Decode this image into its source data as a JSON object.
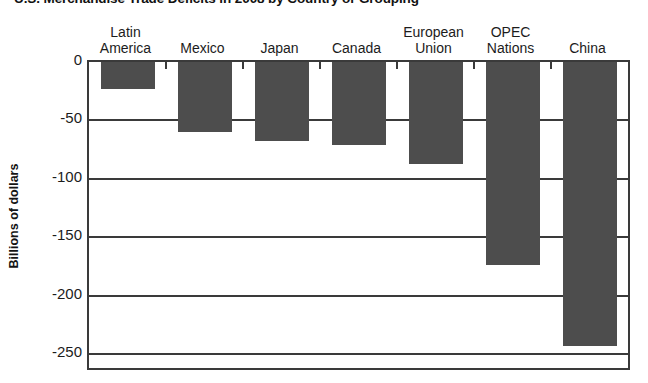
{
  "chart_data": {
    "type": "bar",
    "title": "U.S. Merchandise Trade Deficits in 2008 by Country or Grouping",
    "xlabel": "",
    "ylabel": "Billions of dollars",
    "categories": [
      "Latin\nAmerica",
      "Mexico",
      "Japan",
      "Canada",
      "European\nUnion",
      "OPEC\nNations",
      "China"
    ],
    "values": [
      -23,
      -60,
      -68,
      -71,
      -87,
      -174,
      -243
    ],
    "ylim": [
      -250,
      0
    ],
    "yticks": [
      0,
      -50,
      -100,
      -150,
      -200,
      -250
    ],
    "ytick_labels": [
      "0",
      "-50",
      "-100",
      "-150",
      "-200",
      "-250"
    ],
    "grid": true,
    "legend": "none",
    "bar_color": "#4d4d4d",
    "axis_color": "#3a3a3a",
    "background": "#ffffff"
  }
}
